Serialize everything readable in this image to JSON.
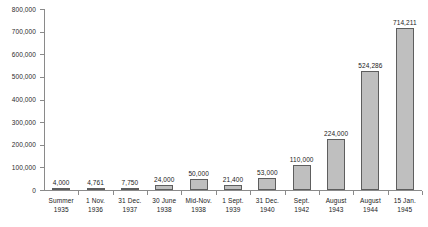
{
  "chart_data": {
    "type": "bar",
    "title": "",
    "subtitle": "",
    "xlabel": "",
    "ylabel": "",
    "ylim": [
      0,
      800000
    ],
    "ytick_step": 100000,
    "grid": false,
    "legend": null,
    "bar_color": "#bfbfbf",
    "bar_border_color": "#5e5e5e",
    "axis_color": "#8a8a8a",
    "categories": [
      "Summer 1935",
      "1 Nov. 1936",
      "31 Dec. 1937",
      "30 June 1938",
      "Mid-Nov. 1938",
      "1 Sept. 1939",
      "31 Dec. 1940",
      "Sept. 1942",
      "August 1943",
      "August 1944",
      "15 Jan. 1945"
    ],
    "category_lines": [
      [
        "Summer",
        "1935"
      ],
      [
        "1 Nov.",
        "1936"
      ],
      [
        "31 Dec.",
        "1937"
      ],
      [
        "30 June",
        "1938"
      ],
      [
        "Mid-Nov.",
        "1938"
      ],
      [
        "1 Sept.",
        "1939"
      ],
      [
        "31 Dec.",
        "1940"
      ],
      [
        "Sept.",
        "1942"
      ],
      [
        "August",
        "1943"
      ],
      [
        "August",
        "1944"
      ],
      [
        "15 Jan.",
        "1945"
      ]
    ],
    "values": [
      4000,
      4761,
      7750,
      24000,
      50000,
      21400,
      53000,
      110000,
      224000,
      524286,
      714211
    ],
    "value_labels": [
      "4,000",
      "4,761",
      "7,750",
      "24,000",
      "50,000",
      "21,400",
      "53,000",
      "110,000",
      "224,000",
      "524,286",
      "714,211"
    ],
    "ytick_labels": [
      "800,000",
      "700,000",
      "600,000",
      "500,000",
      "400,000",
      "300,000",
      "200,000",
      "100,000",
      "0"
    ],
    "ytick_values": [
      800000,
      700000,
      600000,
      500000,
      400000,
      300000,
      200000,
      100000,
      0
    ]
  }
}
